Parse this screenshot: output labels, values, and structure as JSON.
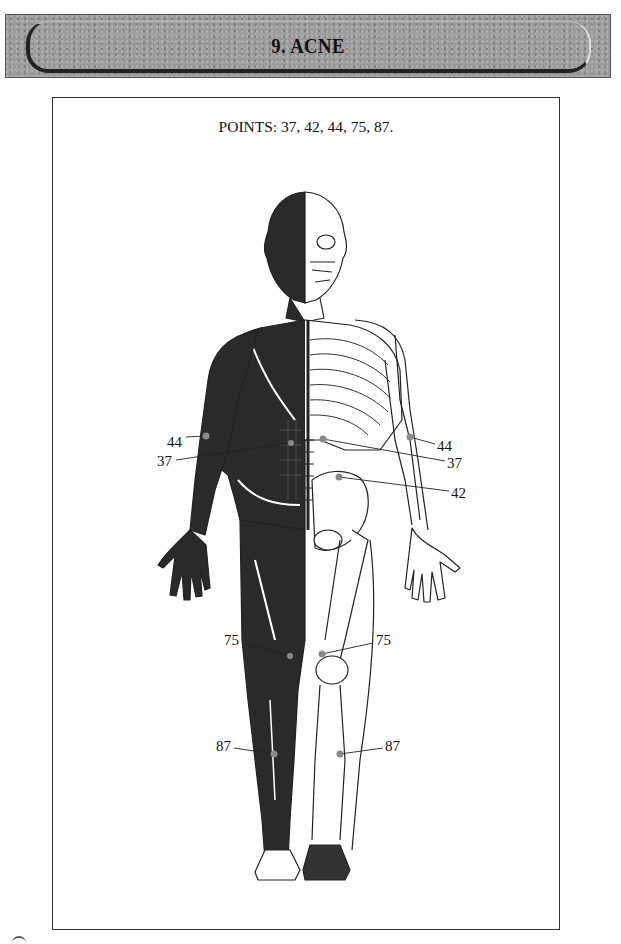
{
  "header": {
    "title": "9. ACNE"
  },
  "figure": {
    "caption": "POINTS: 37, 42, 44, 75, 87.",
    "points": [
      {
        "id": "44",
        "side": "left",
        "label": "44",
        "label_x": 167,
        "label_y": 442,
        "dot_x": 206,
        "dot_y": 436
      },
      {
        "id": "37",
        "side": "left",
        "label": "37",
        "label_x": 157,
        "label_y": 462,
        "dot_x": 291,
        "dot_y": 443
      },
      {
        "id": "44",
        "side": "right",
        "label": "44",
        "label_x": 437,
        "label_y": 447,
        "dot_x": 410,
        "dot_y": 437
      },
      {
        "id": "37",
        "side": "right",
        "label": "37",
        "label_x": 447,
        "label_y": 464,
        "dot_x": 323,
        "dot_y": 439
      },
      {
        "id": "42",
        "side": "right",
        "label": "42",
        "label_x": 451,
        "label_y": 494,
        "dot_x": 339,
        "dot_y": 477
      },
      {
        "id": "75",
        "side": "left",
        "label": "75",
        "label_x": 224,
        "label_y": 641,
        "dot_x": 290,
        "dot_y": 656
      },
      {
        "id": "75",
        "side": "right",
        "label": "75",
        "label_x": 376,
        "label_y": 641,
        "dot_x": 322,
        "dot_y": 654
      },
      {
        "id": "87",
        "side": "left",
        "label": "87",
        "label_x": 216,
        "label_y": 746,
        "dot_x": 274,
        "dot_y": 754
      },
      {
        "id": "87",
        "side": "right",
        "label": "87",
        "label_x": 385,
        "label_y": 746,
        "dot_x": 340,
        "dot_y": 754
      }
    ],
    "colors": {
      "muscle": "#2a2a2a",
      "bone_line": "#222222",
      "point_dot": "#8a8a8a",
      "banner_bg": "#9a9a9a"
    }
  }
}
